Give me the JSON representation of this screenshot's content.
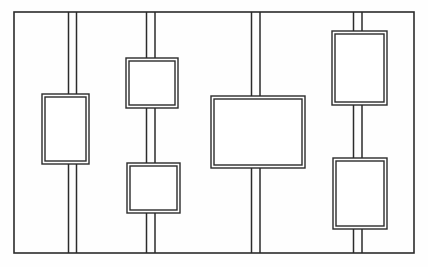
{
  "figure": {
    "kind": "technical-line-drawing",
    "title": "",
    "background_color": "#fefefe",
    "line_color": "#2b2b2b",
    "panel_fill": "#ffffff",
    "canvas": {
      "width": 428,
      "height": 267
    }
  },
  "frame": {
    "name": "outer-frame",
    "x": 14,
    "y": 12,
    "width": 400,
    "height": 241,
    "stroke_width": 1.6
  },
  "rails": [
    {
      "name": "rail-1",
      "x_left": 68.5,
      "x_right": 76.5,
      "y_top": 12,
      "y_bottom": 253,
      "stroke_width": 1.5,
      "gaps": [
        {
          "y_start": 94,
          "y_end": 164
        }
      ]
    },
    {
      "name": "rail-2",
      "x_left": 146.5,
      "x_right": 155.0,
      "y_top": 12,
      "y_bottom": 253,
      "stroke_width": 1.5,
      "gaps": [
        {
          "y_start": 58,
          "y_end": 108
        },
        {
          "y_start": 163,
          "y_end": 213
        }
      ]
    },
    {
      "name": "rail-3",
      "x_left": 251.5,
      "x_right": 260.0,
      "y_top": 12,
      "y_bottom": 253,
      "stroke_width": 1.5,
      "gaps": [
        {
          "y_start": 96,
          "y_end": 168
        }
      ]
    },
    {
      "name": "rail-4",
      "x_left": 353.5,
      "x_right": 362.0,
      "y_top": 12,
      "y_bottom": 253,
      "stroke_width": 1.5,
      "gaps": [
        {
          "y_start": 31,
          "y_end": 105
        },
        {
          "y_start": 158,
          "y_end": 229
        }
      ]
    }
  ],
  "panels": [
    {
      "name": "panel-left",
      "x": 42,
      "y": 94,
      "width": 47,
      "height": 70,
      "inset": 3,
      "stroke_width": 1.4
    },
    {
      "name": "panel-upper-middle",
      "x": 126,
      "y": 58,
      "width": 52,
      "height": 50,
      "inset": 3,
      "stroke_width": 1.4
    },
    {
      "name": "panel-lower-middle",
      "x": 127,
      "y": 163,
      "width": 53,
      "height": 50,
      "inset": 3,
      "stroke_width": 1.4
    },
    {
      "name": "panel-center-large",
      "x": 211,
      "y": 96,
      "width": 94,
      "height": 72,
      "inset": 3,
      "stroke_width": 1.4
    },
    {
      "name": "panel-upper-right",
      "x": 332,
      "y": 31,
      "width": 55,
      "height": 74,
      "inset": 3,
      "stroke_width": 1.4
    },
    {
      "name": "panel-lower-right",
      "x": 333,
      "y": 158,
      "width": 54,
      "height": 71,
      "inset": 3,
      "stroke_width": 1.4
    }
  ]
}
